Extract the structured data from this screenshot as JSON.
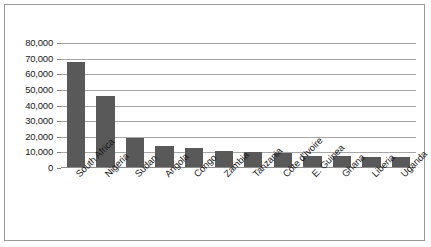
{
  "chart_data": {
    "type": "bar",
    "title": "",
    "subtitle": "",
    "xlabel": "",
    "ylabel": "",
    "categories": [
      "South Africa",
      "Nigeria",
      "Sudan",
      "Angola",
      "Congo",
      "Zambia",
      "Tanzania",
      "Côte d'Ivoire",
      "E. Guinea",
      "Ghana",
      "Liberia",
      "Uganda"
    ],
    "values": [
      68000,
      46000,
      19000,
      14000,
      13000,
      11000,
      10500,
      9500,
      8000,
      7500,
      7000,
      7000
    ],
    "ylim": [
      0,
      80000
    ],
    "ytick_labels": [
      "80,000",
      "70,000",
      "60,000",
      "50,000",
      "40,000",
      "30,000",
      "20,000",
      "10,000",
      "0"
    ],
    "ytick_values": [
      80000,
      70000,
      60000,
      50000,
      40000,
      30000,
      20000,
      10000,
      0
    ],
    "grid": true,
    "legend": false,
    "legend_position": "none",
    "series": [
      {
        "name": "",
        "values": [
          68000,
          46000,
          19000,
          14000,
          13000,
          11000,
          10500,
          9500,
          8000,
          7500,
          7000,
          7000
        ]
      }
    ],
    "colors": {
      "bar": "#595959",
      "gridline": "#a6a6a6",
      "axis": "#8c8c8c",
      "border": "#9a9a9a",
      "background": "#ffffff",
      "text": "#1a1a1a"
    }
  }
}
